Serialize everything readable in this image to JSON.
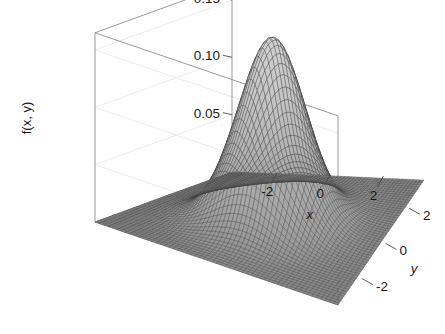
{
  "figure": {
    "background_color": "#ffffff",
    "box_line_color": "#8d8d8d",
    "mesh_color": "#3a3a3a",
    "facet_color": "#cfcfcf",
    "width": 445,
    "height": 334
  },
  "chart_data": {
    "type": "surface",
    "title": "",
    "subtitle": "",
    "xlabel": "x",
    "ylabel": "y",
    "zlabel": "f(x, y)",
    "grid": true,
    "legend": "none",
    "projection": "3d-wireframe",
    "surface_function": "bivariate standard normal density: f(x,y) = (1/(2*pi)) * exp(-(x^2 + y^2)/2)",
    "xlim": [
      -3.6,
      3.6
    ],
    "ylim": [
      -3.6,
      3.6
    ],
    "zlim": [
      0,
      0.165
    ],
    "xticks": [
      -2,
      0,
      2
    ],
    "xtick_labels": [
      "-2",
      "0",
      "2"
    ],
    "yticks": [
      2,
      0,
      -2
    ],
    "ytick_labels": [
      "2",
      "0",
      "-2"
    ],
    "zticks": [
      0.05,
      0.1,
      0.15
    ],
    "ztick_labels": [
      "0.05",
      "0.10",
      "0.15"
    ],
    "peak_value": 0.159,
    "peak_location": [
      0,
      0
    ],
    "mesh_n": 56,
    "samples": {
      "x": [
        -3.6,
        -3.0,
        -2.4,
        -1.8,
        -1.2,
        -0.6,
        0.0,
        0.6,
        1.2,
        1.8,
        2.4,
        3.0,
        3.6
      ],
      "y": [
        -3.6,
        -3.0,
        -2.4,
        -1.8,
        -1.2,
        -0.6,
        0.0,
        0.6,
        1.2,
        1.8,
        2.4,
        3.0,
        3.6
      ],
      "z_at_y0": [
        0.00025,
        0.00177,
        0.00889,
        0.03155,
        0.07749,
        0.13308,
        0.15915,
        0.13308,
        0.07749,
        0.03155,
        0.00889,
        0.00177,
        0.00025
      ],
      "z_at_x0": [
        0.00025,
        0.00177,
        0.00889,
        0.03155,
        0.07749,
        0.13308,
        0.15915,
        0.13308,
        0.07749,
        0.03155,
        0.00889,
        0.00177,
        0.00025
      ]
    }
  },
  "axes": {
    "z": {
      "label": "f(x, y)",
      "ticks": [
        {
          "value": 0.15,
          "label": "0.15"
        },
        {
          "value": 0.1,
          "label": "0.10"
        },
        {
          "value": 0.05,
          "label": "0.05"
        }
      ]
    },
    "x": {
      "label": "x",
      "ticks": [
        {
          "value": -2,
          "label": "-2"
        },
        {
          "value": 0,
          "label": "0"
        },
        {
          "value": 2,
          "label": "2"
        }
      ]
    },
    "y": {
      "label": "y",
      "ticks": [
        {
          "value": 2,
          "label": "2"
        },
        {
          "value": 0,
          "label": "0"
        },
        {
          "value": -2,
          "label": "-2"
        }
      ]
    }
  }
}
